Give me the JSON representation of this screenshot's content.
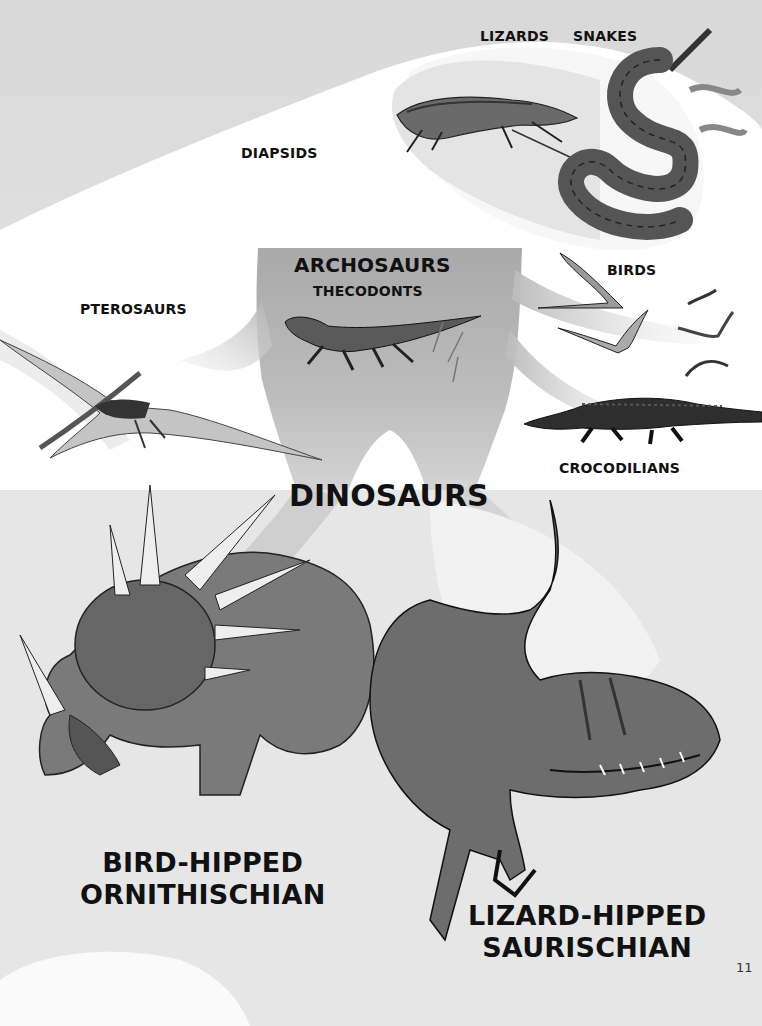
{
  "page": {
    "page_number": "11",
    "colors": {
      "background": "#e2e2e2",
      "branch_gray": "#b8b8b8",
      "branch_white": "#ffffff",
      "text": "#111111"
    }
  },
  "labels": {
    "lizards": "LIZARDS",
    "snakes": "SNAKES",
    "diapsids": "DIAPSIDS",
    "archosaurs": "ARCHOSAURS",
    "thecodonts": "THECODONTS",
    "pterosaurs": "PTEROSAURS",
    "birds": "BIRDS",
    "crocodilians": "CROCODILIANS",
    "dinosaurs": "DINOSAURS",
    "bird_hipped_line1": "BIRD-HIPPED",
    "bird_hipped_line2": "ORNITHISCHIAN",
    "lizard_hipped_line1": "LIZARD-HIPPED",
    "lizard_hipped_line2": "SAURISCHIAN"
  },
  "illustrations": [
    {
      "name": "lizard",
      "group": "LIZARDS"
    },
    {
      "name": "snake",
      "group": "SNAKES"
    },
    {
      "name": "thecodont",
      "group": "THECODONTS"
    },
    {
      "name": "pterosaur",
      "group": "PTEROSAURS"
    },
    {
      "name": "birds",
      "group": "BIRDS"
    },
    {
      "name": "crocodile",
      "group": "CROCODILIANS"
    },
    {
      "name": "styracosaurus",
      "group": "BIRD-HIPPED ORNITHISCHIAN"
    },
    {
      "name": "theropod",
      "group": "LIZARD-HIPPED SAURISCHIAN"
    }
  ]
}
